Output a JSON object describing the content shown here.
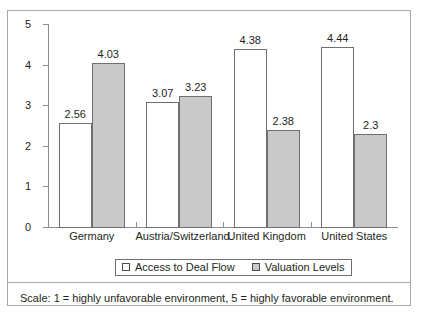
{
  "chart_data": {
    "type": "bar",
    "title": "",
    "subtitle": "",
    "xlabel": "",
    "ylabel": "",
    "ylim": [
      0,
      5
    ],
    "yticks": [
      "0",
      "1",
      "2",
      "3",
      "4",
      "5"
    ],
    "grid": false,
    "legend_position": "bottom",
    "categories": [
      "Germany",
      "Austria/Switzerland",
      "United Kingdom",
      "United States"
    ],
    "series": [
      {
        "name": "Access to Deal Flow",
        "color": "#ffffff",
        "values": [
          2.56,
          3.07,
          4.38,
          4.44
        ],
        "labels": [
          "2.56",
          "3.07",
          "4.38",
          "4.44"
        ]
      },
      {
        "name": "Valuation Levels",
        "color": "#c9c9c9",
        "values": [
          4.03,
          3.23,
          2.38,
          2.3
        ],
        "labels": [
          "4.03",
          "3.23",
          "2.38",
          "2.3"
        ]
      }
    ],
    "footnote": "Scale: 1 = highly unfavorable environment, 5 = highly favorable environment."
  }
}
